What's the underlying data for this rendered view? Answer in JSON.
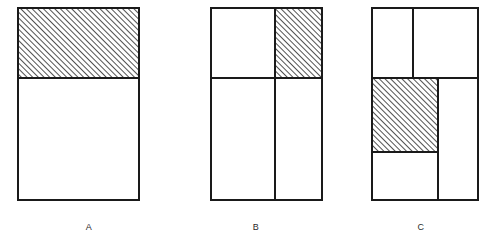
{
  "diagram": {
    "background_color": "#ffffff",
    "stroke_color": "#1a1a1a",
    "hatch_color": "#333333",
    "fill_color": "#ffffff",
    "hatch_direction": "forward-slash",
    "hatch_spacing_px": 4,
    "stroke_width_px": 2,
    "canvas": {
      "width": 494,
      "height": 247
    },
    "figures": [
      {
        "id": "A",
        "label": "A",
        "label_position": {
          "x": 89,
          "y": 228
        },
        "outer_rect": {
          "x": 18,
          "y": 8,
          "width": 121,
          "height": 192
        },
        "dividers": [
          {
            "type": "horizontal",
            "y": 78,
            "x1": 18,
            "x2": 139
          }
        ],
        "cells": [
          {
            "name": "top",
            "x": 18,
            "y": 8,
            "width": 121,
            "height": 70,
            "hatched": true
          },
          {
            "name": "bottom",
            "x": 18,
            "y": 78,
            "width": 121,
            "height": 122,
            "hatched": false
          }
        ],
        "hatched_cell_count": 1,
        "total_cell_count": 2
      },
      {
        "id": "B",
        "label": "B",
        "label_position": {
          "x": 256,
          "y": 228
        },
        "outer_rect": {
          "x": 211,
          "y": 8,
          "width": 111,
          "height": 192
        },
        "dividers": [
          {
            "type": "horizontal",
            "y": 78,
            "x1": 211,
            "x2": 322
          },
          {
            "type": "vertical",
            "x": 275,
            "y1": 8,
            "y2": 200
          }
        ],
        "cells": [
          {
            "name": "top-left",
            "x": 211,
            "y": 8,
            "width": 64,
            "height": 70,
            "hatched": false
          },
          {
            "name": "top-right",
            "x": 275,
            "y": 8,
            "width": 47,
            "height": 70,
            "hatched": true
          },
          {
            "name": "bottom-left",
            "x": 211,
            "y": 78,
            "width": 64,
            "height": 122,
            "hatched": false
          },
          {
            "name": "bottom-right",
            "x": 275,
            "y": 78,
            "width": 47,
            "height": 122,
            "hatched": false
          }
        ],
        "hatched_cell_count": 1,
        "total_cell_count": 4
      },
      {
        "id": "C",
        "label": "C",
        "label_position": {
          "x": 421,
          "y": 228
        },
        "outer_rect": {
          "x": 372,
          "y": 8,
          "width": 106,
          "height": 192
        },
        "dividers": [
          {
            "type": "horizontal",
            "y": 78,
            "x1": 372,
            "x2": 478
          },
          {
            "type": "vertical",
            "x": 413,
            "y1": 8,
            "y2": 78
          },
          {
            "type": "vertical",
            "x": 438,
            "y1": 78,
            "y2": 200
          },
          {
            "type": "horizontal",
            "y": 152,
            "x1": 372,
            "x2": 438
          }
        ],
        "cells": [
          {
            "name": "top-left",
            "x": 372,
            "y": 8,
            "width": 41,
            "height": 70,
            "hatched": false
          },
          {
            "name": "top-right",
            "x": 413,
            "y": 8,
            "width": 65,
            "height": 70,
            "hatched": false
          },
          {
            "name": "middle-left",
            "x": 372,
            "y": 78,
            "width": 66,
            "height": 74,
            "hatched": true
          },
          {
            "name": "lower-left",
            "x": 372,
            "y": 152,
            "width": 66,
            "height": 48,
            "hatched": false
          },
          {
            "name": "right-column",
            "x": 438,
            "y": 78,
            "width": 40,
            "height": 122,
            "hatched": false
          }
        ],
        "hatched_cell_count": 1,
        "total_cell_count": 5
      }
    ]
  }
}
